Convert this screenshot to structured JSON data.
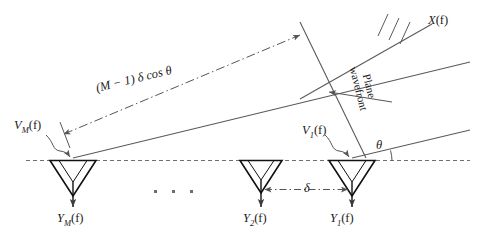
{
  "figure": {
    "kind": "uniform-linear-array-plane-wave-diagram",
    "background_color": "#ffffff",
    "line_color": "#4a4a4a",
    "text_color": "#1a1a1a"
  },
  "labels": {
    "source_signal": {
      "base": "X",
      "arg": "(f)"
    },
    "sensor_m_input": {
      "base": "V",
      "sub": "M",
      "arg": "(f)"
    },
    "sensor_1_input": {
      "base": "V",
      "sub": "1",
      "arg": "(f)"
    },
    "sensor_m_output": {
      "base": "Y",
      "sub": "M",
      "arg": "(f)"
    },
    "sensor_2_output": {
      "base": "Y",
      "sub": "2",
      "arg": "(f)"
    },
    "sensor_1_output": {
      "base": "Y",
      "sub": "1",
      "arg": "(f)"
    },
    "angle": "θ",
    "spacing": "δ",
    "path_difference": "(M − 1) δ cos θ",
    "wavefront_line1": "Plane",
    "wavefront_line2": "wavefront"
  },
  "geometry": {
    "baseline_y": 160,
    "sensor_x": [
      73,
      261,
      352
    ],
    "incidence_angle_deg": 13.5,
    "ellipsis_x": [
      154,
      172,
      190
    ],
    "ellipsis_y": 190
  }
}
